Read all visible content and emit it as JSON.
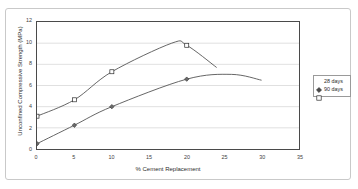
{
  "chart_data": {
    "type": "line",
    "title": "",
    "xlabel": "% Cement Replacement",
    "ylabel": "Unconfined Compressive Strength (MPa)",
    "xlim": [
      0,
      35
    ],
    "ylim": [
      0,
      12
    ],
    "xticks": [
      "0",
      "5",
      "10",
      "15",
      "20",
      "25",
      "30",
      "35"
    ],
    "yticks": [
      "0",
      "2",
      "4",
      "6",
      "8",
      "10",
      "12"
    ],
    "grid": "horizontal",
    "legend_position": "right",
    "series": [
      {
        "name": "28 days",
        "marker": "filled-diamond",
        "x": [
          0,
          5,
          10,
          20
        ],
        "values": [
          0.5,
          2.25,
          4.0,
          6.6
        ],
        "curve_end_x": 30,
        "curve_end_y": 6.5,
        "curve_peak_x": 26,
        "curve_peak_y": 7.05
      },
      {
        "name": "90 days",
        "marker": "open-square",
        "x": [
          0,
          5,
          10,
          20
        ],
        "values": [
          3.1,
          4.65,
          7.3,
          9.8
        ],
        "curve_end_x": 24,
        "curve_end_y": 7.7,
        "curve_peak_x": 18,
        "curve_peak_y": 10.0
      }
    ]
  },
  "legend": {
    "items": [
      {
        "label": "28 days"
      },
      {
        "label": "90 days"
      }
    ]
  },
  "colors": {
    "line": "#555555",
    "axis": "#4a4a4a",
    "grid": "#d8d8d8",
    "frame": "#c9c9c9",
    "text": "#2d2d2d"
  }
}
